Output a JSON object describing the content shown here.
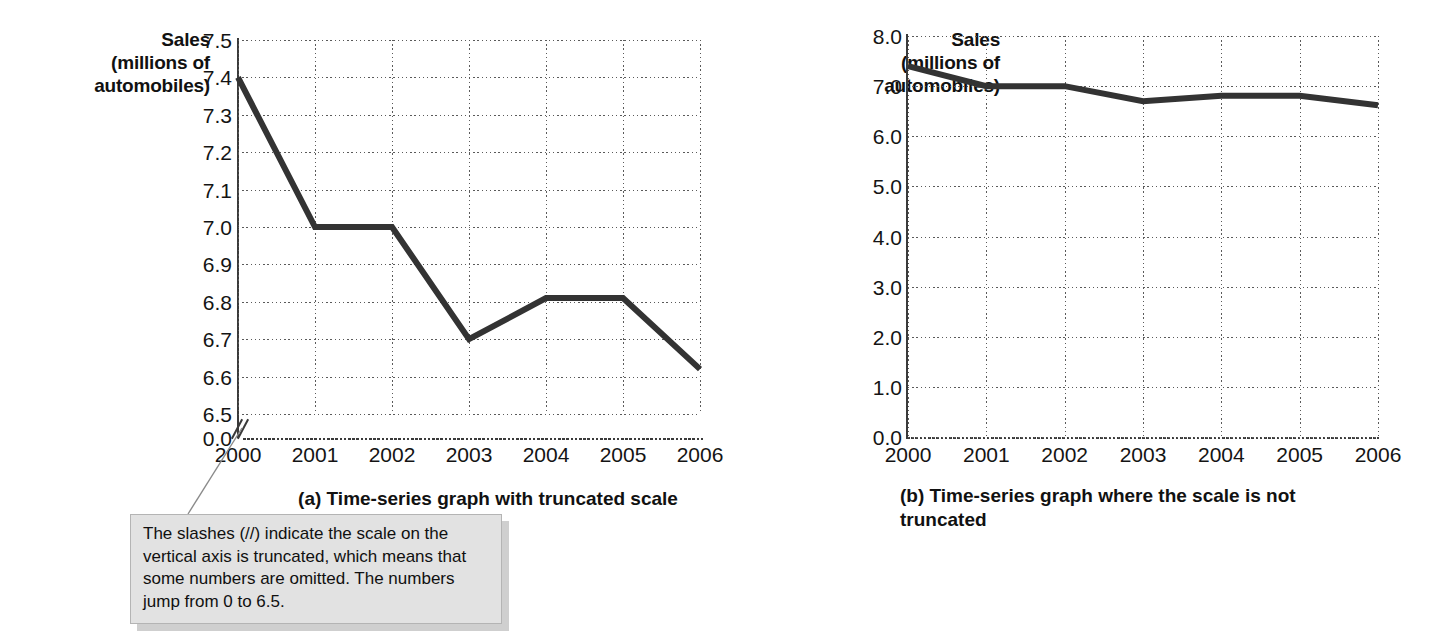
{
  "figure": {
    "background_color": "#ffffff",
    "line_color": "#333333",
    "grid_color": "#5a5a5a",
    "callout_fill": "#e2e2e2"
  },
  "panel_a": {
    "axis_title": "Sales\n(millions of\nautomobiles)",
    "axis_title_lines": [
      "Sales",
      "(millions of",
      "automobiles)"
    ],
    "caption": "(a) Time-series graph with truncated scale",
    "axis_break_icon": "axis-break-slashes"
  },
  "panel_b": {
    "axis_title_lines": [
      "Sales",
      "(millions of",
      "automobiles)"
    ],
    "caption": "(b) Time-series graph where the scale is not truncated"
  },
  "callout": {
    "text": "The slashes (//) indicate the scale on the vertical axis is truncated, which means that some numbers are omitted. The numbers jump from 0 to 6.5."
  },
  "chart_data": [
    {
      "type": "line",
      "id": "panel-a-truncated",
      "title": "(a) Time-series graph with truncated scale",
      "xlabel": "",
      "ylabel": "Sales (millions of automobiles)",
      "categories": [
        "2000",
        "2001",
        "2002",
        "2003",
        "2004",
        "2005",
        "2006"
      ],
      "x": [
        2000,
        2001,
        2002,
        2003,
        2004,
        2005,
        2006
      ],
      "values": [
        7.4,
        7.0,
        7.0,
        6.7,
        6.81,
        6.81,
        6.62
      ],
      "series": [
        {
          "name": "Automobile sales",
          "values": [
            7.4,
            7.0,
            7.0,
            6.7,
            6.81,
            6.81,
            6.62
          ]
        }
      ],
      "ylim": [
        6.5,
        7.5
      ],
      "yticks": [
        "0.0",
        "6.5",
        "6.6",
        "6.7",
        "6.8",
        "6.9",
        "7.0",
        "7.1",
        "7.2",
        "7.3",
        "7.4",
        "7.5"
      ],
      "ytick_values": [
        0.0,
        6.5,
        6.6,
        6.7,
        6.8,
        6.9,
        7.0,
        7.1,
        7.2,
        7.3,
        7.4,
        7.5
      ],
      "xticks": [
        "2000",
        "2001",
        "2002",
        "2003",
        "2004",
        "2005",
        "2006"
      ],
      "truncated_axis": true,
      "truncation_note": "axis jumps from 0 to 6.5",
      "grid": true,
      "legend": "none"
    },
    {
      "type": "line",
      "id": "panel-b-full-scale",
      "title": "(b) Time-series graph where the scale is not truncated",
      "xlabel": "",
      "ylabel": "Sales (millions of automobiles)",
      "categories": [
        "2000",
        "2001",
        "2002",
        "2003",
        "2004",
        "2005",
        "2006"
      ],
      "x": [
        2000,
        2001,
        2002,
        2003,
        2004,
        2005,
        2006
      ],
      "values": [
        7.4,
        7.0,
        7.0,
        6.7,
        6.81,
        6.81,
        6.62
      ],
      "series": [
        {
          "name": "Automobile sales",
          "values": [
            7.4,
            7.0,
            7.0,
            6.7,
            6.81,
            6.81,
            6.62
          ]
        }
      ],
      "ylim": [
        0.0,
        8.0
      ],
      "yticks": [
        "0.0",
        "1.0",
        "2.0",
        "3.0",
        "4.0",
        "5.0",
        "6.0",
        "7.0",
        "8.0"
      ],
      "ytick_values": [
        0.0,
        1.0,
        2.0,
        3.0,
        4.0,
        5.0,
        6.0,
        7.0,
        8.0
      ],
      "xticks": [
        "2000",
        "2001",
        "2002",
        "2003",
        "2004",
        "2005",
        "2006"
      ],
      "truncated_axis": false,
      "grid": true,
      "legend": "none"
    }
  ]
}
